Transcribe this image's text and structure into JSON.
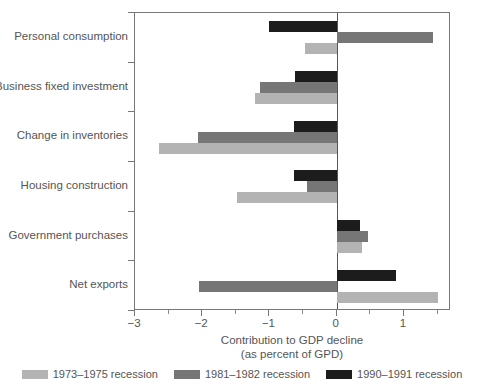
{
  "chart_data": {
    "type": "bar",
    "orientation": "horizontal",
    "title": "",
    "xlabel_line1": "Contribution to GDP decline",
    "xlabel_line2": "(as percent of GPD)",
    "ylabel": "",
    "xlim": [
      -3.0,
      1.7
    ],
    "xticks": [
      -3,
      -2,
      -1,
      0,
      1
    ],
    "xtick_labels": [
      "−3",
      "−2",
      "−1",
      "0",
      "1"
    ],
    "grid": false,
    "legend_position": "bottom",
    "categories": [
      "Personal consumption",
      "Business fixed investment",
      "Change in inventories",
      "Housing construction",
      "Government purchases",
      "Net exports"
    ],
    "series": [
      {
        "name": "1973–1975 recession",
        "color": "#b3b3b3",
        "values": [
          -0.47,
          -1.22,
          -2.64,
          -1.49,
          0.38,
          1.5
        ]
      },
      {
        "name": "1981–1982 recession",
        "color": "#767676",
        "values": [
          1.43,
          -1.14,
          -2.07,
          -0.44,
          0.46,
          -2.05
        ]
      },
      {
        "name": "1990–1991 recession",
        "color": "#1c1c1c",
        "values": [
          -1.01,
          -0.62,
          -0.64,
          -0.64,
          0.35,
          0.88
        ]
      }
    ]
  },
  "legend": {
    "items": [
      {
        "label": "1973–1975 recession",
        "color": "#b3b3b3"
      },
      {
        "label": "1981–1982 recession",
        "color": "#767676"
      },
      {
        "label": "1990–1991 recession",
        "color": "#1c1c1c"
      }
    ]
  }
}
